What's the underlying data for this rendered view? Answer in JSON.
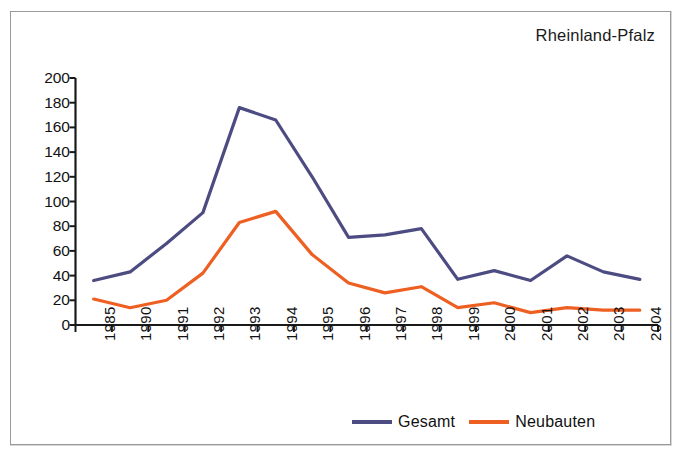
{
  "chart_data": {
    "type": "line",
    "title": "Rheinland-Pfalz",
    "xlabel": "",
    "ylabel": "",
    "categories": [
      "1985",
      "1990",
      "1991",
      "1992",
      "1993",
      "1994",
      "1995",
      "1996",
      "1997",
      "1998",
      "1999",
      "2000",
      "2001",
      "2002",
      "2003",
      "2004"
    ],
    "ylim": [
      0,
      200
    ],
    "yticks": [
      0,
      20,
      40,
      60,
      80,
      100,
      120,
      140,
      160,
      180,
      200
    ],
    "grid": false,
    "legend_position": "bottom-right",
    "series": [
      {
        "name": "Gesamt",
        "color": "#4c4c82",
        "values": [
          36,
          43,
          66,
          91,
          176,
          166,
          120,
          71,
          73,
          78,
          37,
          44,
          36,
          56,
          43,
          37
        ]
      },
      {
        "name": "Neubauten",
        "color": "#ee5f22",
        "values": [
          21,
          14,
          20,
          42,
          83,
          92,
          57,
          34,
          26,
          31,
          14,
          18,
          10,
          14,
          12,
          12
        ]
      }
    ]
  },
  "axis": {
    "color": "#1a1a1a"
  },
  "frame": {
    "border_color": "#9a9a9a"
  }
}
